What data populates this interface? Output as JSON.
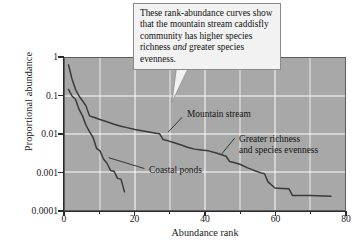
{
  "figure": {
    "background_color": "#ffffff",
    "plot_background_color": "#a8a8a8",
    "grid_color": "#ffffff",
    "curve_color": "#3a3a3a"
  },
  "callout": {
    "line1": "These rank-abundance curves show",
    "line2": "that the mountain stream caddisfly",
    "line3": "community has higher species",
    "line4_a": "richness ",
    "line4_italic": "and",
    "line4_b": " greater species evenness."
  },
  "annotations": {
    "mountain_stream": "Mountain stream",
    "greater_richness_line1": "Greater richness",
    "greater_richness_line2": "and species evenness",
    "coastal_ponds": "Coastal ponds"
  },
  "chart_data": {
    "type": "line",
    "title": "",
    "xlabel": "Abundance rank",
    "ylabel": "Proportional abundance",
    "xlim": [
      0,
      80
    ],
    "ylim": [
      0.0001,
      1
    ],
    "yscale": "log",
    "grid": true,
    "legend_position": "inline-annotations",
    "xticks": [
      0,
      20,
      40,
      60,
      80
    ],
    "xticklabels": [
      "0",
      "20",
      "40",
      "60",
      "80"
    ],
    "xminorticks": [
      10,
      30,
      50,
      70
    ],
    "yticks": [
      1,
      0.1,
      0.01,
      0.001,
      0.0001
    ],
    "yticklabels": [
      "1",
      "0.1",
      "0.01",
      "0.001",
      "0.0001"
    ],
    "series": [
      {
        "name": "Mountain stream",
        "x": [
          1,
          2,
          3,
          4,
          5,
          6,
          7,
          8,
          10,
          12,
          14,
          16,
          18,
          20,
          22,
          24,
          26,
          27,
          28,
          29,
          31,
          33,
          35,
          37,
          39,
          41,
          43,
          45,
          46,
          47,
          48,
          50,
          52,
          54,
          56,
          57,
          58,
          60,
          62,
          64,
          65,
          66,
          70,
          76
        ],
        "y": [
          0.66,
          0.28,
          0.15,
          0.1,
          0.075,
          0.055,
          0.03,
          0.028,
          0.024,
          0.021,
          0.018,
          0.016,
          0.0145,
          0.0132,
          0.0122,
          0.0113,
          0.0105,
          0.0102,
          0.0072,
          0.0068,
          0.006,
          0.0052,
          0.0045,
          0.004,
          0.0038,
          0.0036,
          0.0032,
          0.0028,
          0.0026,
          0.0019,
          0.0018,
          0.0016,
          0.0013,
          0.0011,
          0.00095,
          0.0009,
          0.00055,
          0.00038,
          0.00037,
          0.00036,
          0.00024,
          0.00024,
          0.00024,
          0.00023
        ]
      },
      {
        "name": "Coastal ponds",
        "x": [
          1,
          2,
          3,
          4,
          5,
          6,
          7,
          8,
          9,
          10,
          11,
          12,
          13,
          14,
          15,
          16,
          17
        ],
        "y": [
          0.15,
          0.1,
          0.082,
          0.045,
          0.03,
          0.017,
          0.0115,
          0.0082,
          0.0042,
          0.0036,
          0.0022,
          0.0017,
          0.0011,
          0.00105,
          0.00068,
          0.00065,
          0.0003
        ]
      }
    ]
  }
}
